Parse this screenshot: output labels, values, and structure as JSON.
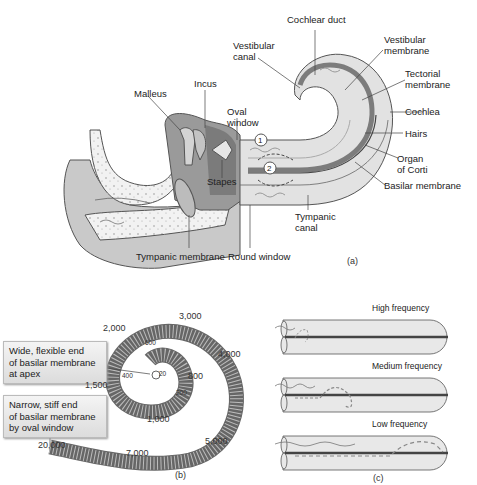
{
  "panel_a": {
    "caption": "(a)",
    "labels": {
      "cochlear_duct": "Cochlear duct",
      "vestibular_canal": "Vestibular\ncanal",
      "vestibular_membrane": "Vestibular\nmembrane",
      "tectorial_membrane": "Tectorial\nmembrane",
      "cochlea": "Cochlea",
      "hairs": "Hairs",
      "organ_of_corti": "Organ\nof Corti",
      "basilar_membrane": "Basilar membrane",
      "tympanic_canal": "Tympanic\ncanal",
      "malleus": "Malleus",
      "incus": "Incus",
      "oval_window": "Oval\nwindow",
      "stapes": "Stapes",
      "tympanic_membrane": "Tympanic membrane",
      "round_window": "Round window",
      "marker_1": "1",
      "marker_2": "2"
    }
  },
  "panel_b": {
    "caption": "(b)",
    "note_apex": "Wide, flexible end\nof basilar membrane\nat apex",
    "note_base": "Narrow, stiff end\nof basilar membrane\nby oval window",
    "frequencies": [
      "20",
      "200",
      "400",
      "600",
      "800",
      "1,000",
      "1,500",
      "2,000",
      "3,000",
      "4,000",
      "5,000",
      "7,000",
      "20,000"
    ]
  },
  "panel_c": {
    "caption": "(c)",
    "rows": [
      {
        "title": "High frequency"
      },
      {
        "title": "Medium frequency"
      },
      {
        "title": "Low frequency"
      }
    ]
  },
  "colors": {
    "tissue_dark": "#8a8a8a",
    "tissue_mid": "#b8b8b8",
    "tissue_light": "#dcdcdc",
    "outline": "#555555"
  }
}
